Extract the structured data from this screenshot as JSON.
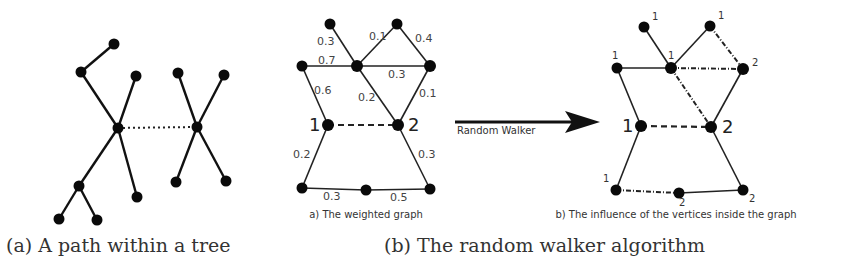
{
  "captions": {
    "a": "(a) A path within a tree",
    "b": "(b) The random walker algorithm"
  },
  "panel_b": {
    "left_subcaption": "a) The weighted graph",
    "right_subcaption": "b) The influence of the vertices inside the graph",
    "arrow_label": "Random Walker"
  },
  "weighted_graph": {
    "seed_labels": {
      "seed1": "1",
      "seed2": "2"
    },
    "edge_weights": {
      "top_left_to_center": "0.3",
      "center_to_top_right": "0.1",
      "top_right_to_right": "0.4",
      "left_to_center": "0.7",
      "center_to_right": "0.3",
      "left_to_seed1": "0.6",
      "center_to_seed2": "0.2",
      "right_to_seed2": "0.1",
      "seed1_to_bottom_left": "0.2",
      "seed2_to_bottom_right": "0.3",
      "bottom_left_to_bottom_mid": "0.3",
      "bottom_mid_to_bottom_right": "0.5"
    }
  },
  "influence_graph": {
    "seed_labels": {
      "seed1": "1",
      "seed2": "2"
    },
    "vertex_labels": {
      "top_left": "1",
      "top_right": "1",
      "left": "1",
      "center": "1",
      "right": "2",
      "bottom_left": "1",
      "bottom_mid": "2",
      "bottom_right": "2"
    }
  }
}
